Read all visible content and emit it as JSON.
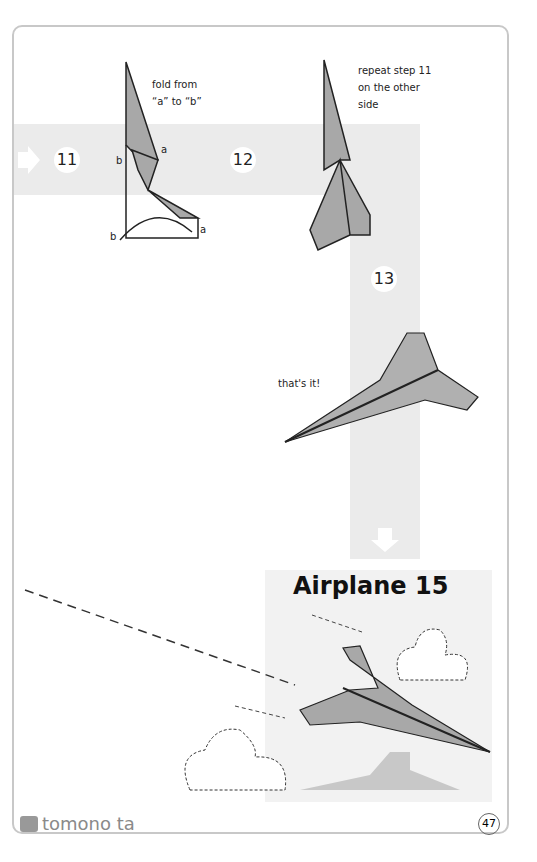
{
  "steps": [
    {
      "number": "11",
      "note_lines": [
        "fold from",
        "“a” to “b”"
      ],
      "labels": [
        "a",
        "b",
        "a",
        "b"
      ]
    },
    {
      "number": "12",
      "note_lines": [
        "repeat step 11",
        "on the other",
        "side"
      ]
    },
    {
      "number": "13",
      "note_lines": [
        "that's it!"
      ]
    }
  ],
  "final": {
    "title": "Airplane 15"
  },
  "footer": {
    "brand": "tomono ta",
    "page_number": "47"
  },
  "colors": {
    "paper": "#a8a8a8",
    "band": "#ebebeb",
    "border": "#c8c8c8"
  }
}
